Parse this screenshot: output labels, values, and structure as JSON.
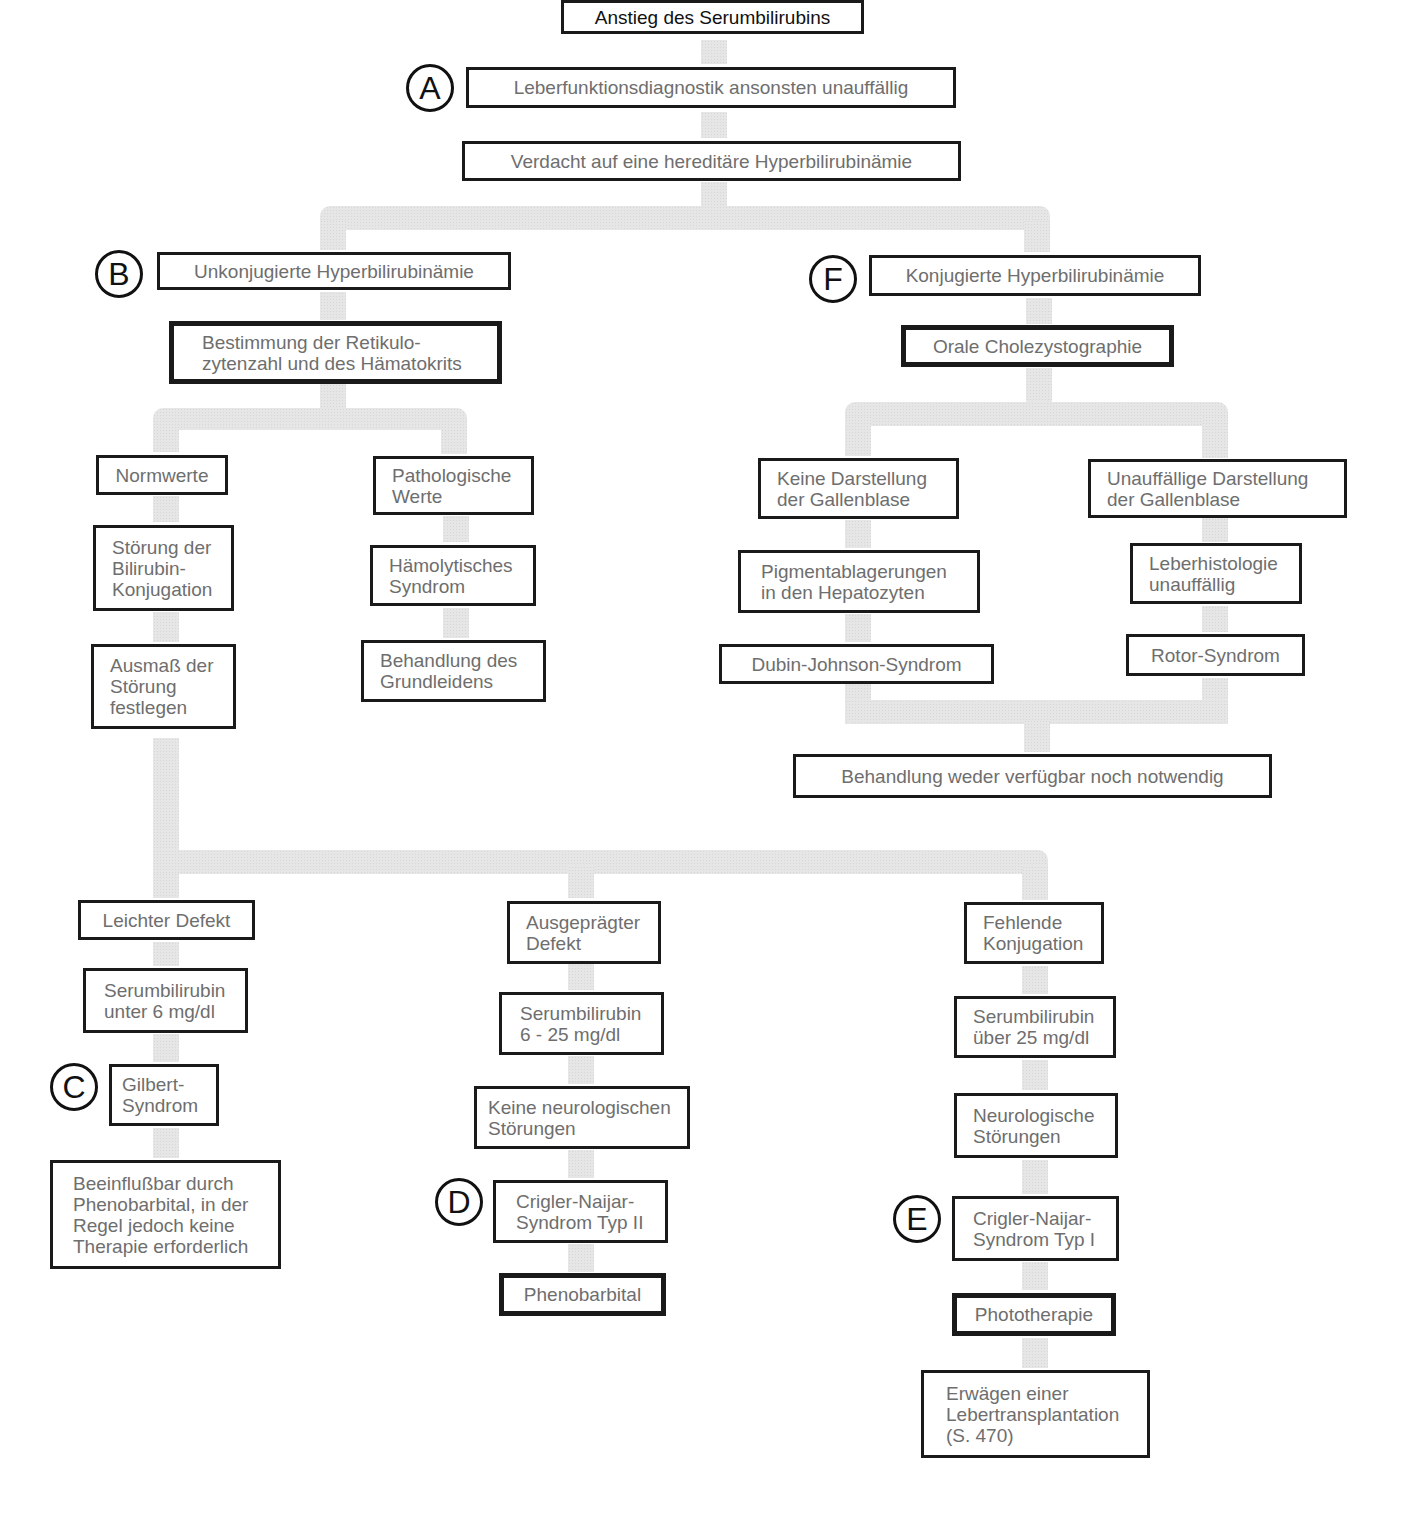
{
  "diagram": {
    "title": "Anstieg des Serumbilirubins",
    "connector_color": "#e4e4e4",
    "border_color": "#1a1a1a",
    "text_color": "#6e6e6e",
    "markers": {
      "A": "A",
      "B": "B",
      "C": "C",
      "D": "D",
      "E": "E",
      "F": "F"
    },
    "nodes": {
      "leberfunktion": "Leberfunktionsdiagnostik ansonsten unauffällig",
      "verdacht": "Verdacht auf eine hereditäre Hyperbilirubinämie",
      "unkonjugiert": "Unkonjugierte Hyperbilirubinämie",
      "bestimmung": "Bestimmung der Retikulo-\nzytenzahl und des Hämatokrits",
      "normwerte": "Normwerte",
      "pathologisch": "Pathologische\nWerte",
      "stoerung_konjugation": "Störung der\nBilirubin-\nKonjugation",
      "haemolytisch": "Hämolytisches\nSyndrom",
      "ausmass": "Ausmaß der\nStörung\nfestlegen",
      "behandlung_grundleiden": "Behandlung des\nGrundleidens",
      "konjugiert": "Konjugierte Hyperbilirubinämie",
      "cholezystographie": "Orale Cholezystographie",
      "keine_darstellung": "Keine Darstellung\nder Gallenblase",
      "unauffaellige_darstellung": "Unauffällige Darstellung\nder Gallenblase",
      "pigment": "Pigmentablagerungen\nin den Hepatozyten",
      "leberhistologie": "Leberhistologie\nunauffällig",
      "dubin_johnson": "Dubin-Johnson-Syndrom",
      "rotor": "Rotor-Syndrom",
      "behandlung_weder": "Behandlung weder verfügbar noch notwendig",
      "leichter_defekt": "Leichter Defekt",
      "serum_unter6": "Serumbilirubin\nunter 6 mg/dl",
      "gilbert": "Gilbert-\nSyndrom",
      "beeinflussbar": "Beeinflußbar durch\nPhenobarbital, in der\nRegel jedoch keine\nTherapie erforderlich",
      "ausgepraegter_defekt": "Ausgeprägter\nDefekt",
      "serum_6_25": "Serumbilirubin\n6 - 25 mg/dl",
      "keine_neuro": "Keine neurologischen\nStörungen",
      "crigler2": "Crigler-Naijar-\nSyndrom Typ II",
      "phenobarbital": "Phenobarbital",
      "fehlende_konjugation": "Fehlende\nKonjugation",
      "serum_ueber25": "Serumbilirubin\nüber 25 mg/dl",
      "neuro": "Neurologische\nStörungen",
      "crigler1": "Crigler-Naijar-\nSyndrom Typ I",
      "phototherapie": "Phototherapie",
      "lebertransplantation": "Erwägen einer\nLebertransplantation\n(S. 470)"
    }
  }
}
